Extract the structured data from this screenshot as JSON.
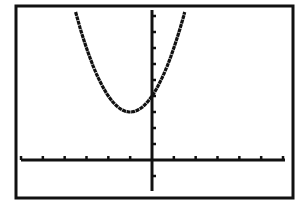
{
  "chart_data": {
    "type": "line",
    "title": "",
    "xlabel": "",
    "ylabel": "",
    "function": "y = (x + 1)^2 + 3",
    "window": {
      "xmin": -6,
      "xmax": 6,
      "xscl": 1,
      "ymin": -2,
      "ymax": 10,
      "yscl": 1
    },
    "xlim": [
      -6,
      6
    ],
    "ylim": [
      -2,
      10
    ],
    "grid": false,
    "legend": null,
    "vertex": {
      "x": -1,
      "y": 3
    },
    "y_intercept": 4,
    "series": [
      {
        "name": "parabola",
        "x": [
          -4.2,
          -4,
          -3.5,
          -3,
          -2.5,
          -2,
          -1.5,
          -1,
          -0.5,
          0,
          0.5,
          1,
          1.5,
          1.9
        ],
        "values": [
          13.24,
          12,
          9.25,
          7,
          5.25,
          4,
          3.25,
          3,
          3.25,
          4,
          5.25,
          7,
          9.25,
          11.41
        ]
      }
    ],
    "colors": {
      "curve": "#111111",
      "axes": "#111111",
      "border": "#111111",
      "background": "#ffffff"
    }
  },
  "labels": {
    "description": "Graphing calculator screen showing an upward-opening parabola"
  }
}
